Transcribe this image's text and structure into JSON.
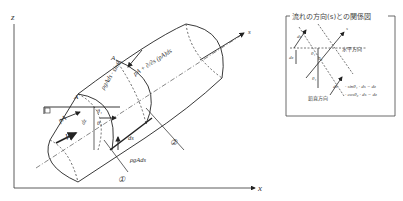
{
  "axes": {
    "z_label": "z",
    "x_label": "x",
    "s_label": "s"
  },
  "main_diagram": {
    "labels": {
      "A_top": "A",
      "A_left": "A",
      "pA": "pA",
      "V": "V",
      "dz": "dz",
      "theta1_2": "θ₁",
      "theta2": "θ₂",
      "weight_component": "ρgAds · sinθ₁",
      "pressure_downstream": "pA + ∂/∂s (pA)ds",
      "ds": "ds",
      "weight": "ρgAds",
      "section_1": "①",
      "section_2": "②"
    }
  },
  "inset": {
    "title": "流れの方向(s)との関係図",
    "labels": {
      "s": "s",
      "ds_top": "ds",
      "ds_bottom": "ds",
      "dz": "dz",
      "horizontal": "水平方向",
      "vertical": "鉛直方向",
      "theta1": "θ₁",
      "theta2": "θ₂",
      "theta1_low": "θ₁",
      "eq1": "· sinθ₁ · ds = dz",
      "eq2": "· cosθ₂ · ds = dz"
    }
  },
  "colors": {
    "line": "#222222",
    "dashed": "#555555",
    "text": "#333333"
  }
}
